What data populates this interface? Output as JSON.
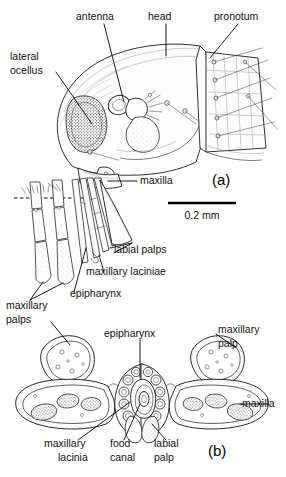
{
  "figure": {
    "background_color": "#ffffff",
    "line_color": "#000000",
    "panels": [
      {
        "id": "a",
        "label": "(a)",
        "description": "lateral view of head and pronotum with mouthpart cone"
      },
      {
        "id": "b",
        "label": "(b)",
        "description": "transverse section through mouthpart cone"
      }
    ],
    "scale_bar": {
      "label": "0.2 mm",
      "length_px": 68
    }
  },
  "labels": {
    "antenna": "antenna",
    "head": "head",
    "pronotum": "pronotum",
    "lateral_ocellus_line1": "lateral",
    "lateral_ocellus_line2": "ocellus",
    "maxilla_a": "maxilla",
    "labial_palps": "labial palps",
    "maxillary_laciniae": "maxillary laciniae",
    "epipharynx_a": "epipharynx",
    "maxillary_palps_line1": "maxillary",
    "maxillary_palps_line2": "palps",
    "epipharynx_b": "epipharynx",
    "maxillary_palp_line1": "maxillary",
    "maxillary_palp_line2": "palp",
    "maxilla_b": "maxilla",
    "maxillary_lacinia_line1": "maxillary",
    "maxillary_lacinia_line2": "lacinia",
    "food_canal_line1": "food",
    "food_canal_line2": "canal",
    "labial_palp_line1": "labial",
    "labial_palp_line2": "palp",
    "panel_a": "(a)",
    "panel_b": "(b)",
    "scale": "0.2 mm"
  }
}
